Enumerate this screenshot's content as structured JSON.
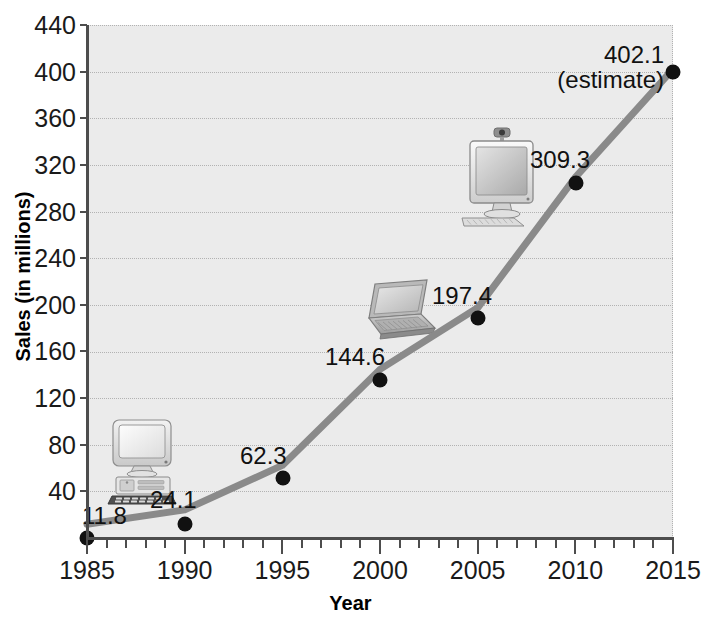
{
  "chart_data": {
    "type": "line",
    "title": "",
    "xlabel": "Year",
    "ylabel": "Sales (in millions)",
    "x": [
      1985,
      1990,
      1995,
      2000,
      2005,
      2010,
      2015
    ],
    "values": [
      11.8,
      24.1,
      62.3,
      144.6,
      197.4,
      309.3,
      402.1
    ],
    "point_labels": [
      "11.8",
      "24.1",
      "62.3",
      "144.6",
      "197.4",
      "309.3",
      "402.1"
    ],
    "annotations": [
      "(estimate)"
    ],
    "estimate_point": 2015,
    "xlim": [
      1985,
      2015
    ],
    "ylim": [
      0,
      440
    ],
    "ytick_labels": [
      "40",
      "80",
      "120",
      "160",
      "200",
      "240",
      "280",
      "320",
      "360",
      "400",
      "440"
    ],
    "ytick_values": [
      40,
      80,
      120,
      160,
      200,
      240,
      280,
      320,
      360,
      400,
      440
    ],
    "xtick_labels": [
      "1985",
      "1990",
      "1995",
      "2000",
      "2005",
      "2010",
      "2015"
    ],
    "xtick_values": [
      1985,
      1990,
      1995,
      2000,
      2005,
      2010,
      2015
    ],
    "x_minor_step": 1,
    "grid": "horizontal-dotted",
    "legend": "none",
    "series_color": "#8a8a8a",
    "marker_color": "#111111",
    "plot_background": "#ebebeb",
    "axis_color": "#4d4d4d"
  },
  "axis_titles": {
    "y": "Sales (in millions)",
    "x": "Year"
  },
  "decorations": [
    {
      "name": "crt-desktop-computer-icon",
      "near_year": 1985
    },
    {
      "name": "laptop-computer-icon",
      "near_year": 2000
    },
    {
      "name": "lcd-monitor-computer-icon",
      "near_year": 2007
    }
  ]
}
